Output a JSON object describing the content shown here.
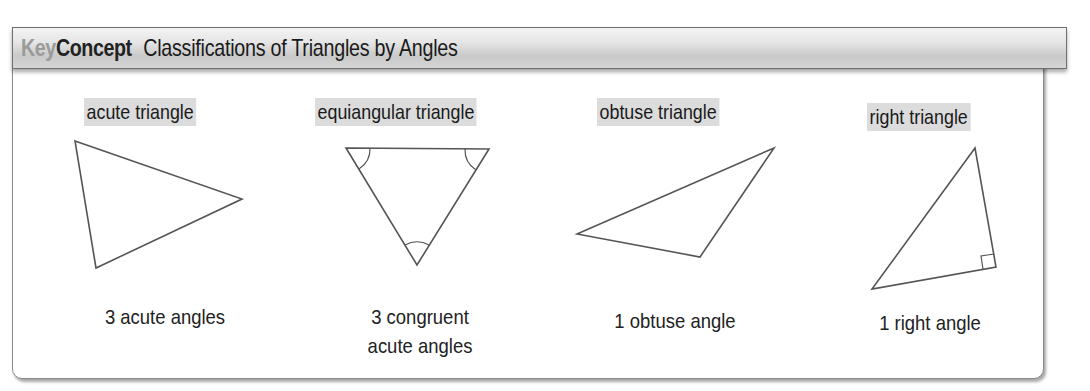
{
  "header": {
    "key": "Key",
    "concept": "Concept",
    "title": "Classifications of Triangles by Angles"
  },
  "triangles": [
    {
      "label": "acute triangle",
      "description": "3 acute angles",
      "vertices": [
        [
          75,
          141
        ],
        [
          242,
          199
        ],
        [
          96,
          268
        ]
      ],
      "marks": []
    },
    {
      "label": "equiangular triangle",
      "description_line1": "3 congruent",
      "description_line2": "acute angles",
      "vertices": [
        [
          346,
          148
        ],
        [
          489,
          149
        ],
        [
          417,
          265
        ]
      ],
      "marks": [
        "congruent-angle-arc",
        "congruent-angle-arc",
        "congruent-angle-arc"
      ]
    },
    {
      "label": "obtuse triangle",
      "description": "1 obtuse angle",
      "vertices": [
        [
          577,
          234
        ],
        [
          774,
          148
        ],
        [
          700,
          257
        ]
      ],
      "marks": []
    },
    {
      "label": "right triangle",
      "description": "1 right angle",
      "vertices": [
        [
          975,
          148
        ],
        [
          996,
          267
        ],
        [
          872,
          289
        ]
      ],
      "marks": [
        "right-angle-square"
      ]
    }
  ],
  "colors": {
    "key_text": "#9a9a9a",
    "label_highlight": "#dcdcdc",
    "stroke": "#555555"
  }
}
